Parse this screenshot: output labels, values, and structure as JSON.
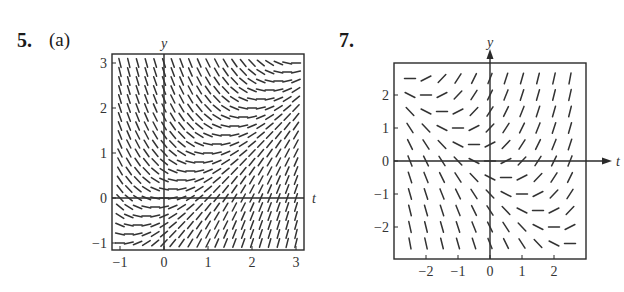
{
  "problems": [
    {
      "number": "5.",
      "part": "(a)"
    },
    {
      "number": "7.",
      "part": ""
    }
  ],
  "chart_data": [
    {
      "type": "slope-field",
      "id": "problem-5a",
      "title": "5. (a)",
      "xlabel": "t",
      "ylabel": "y",
      "equation_estimate": "y' = t - y",
      "xlim": [
        -1,
        3
      ],
      "ylim": [
        -1,
        3
      ],
      "xticks": [
        -1,
        0,
        1,
        2,
        3
      ],
      "yticks": [
        -1,
        0,
        1,
        2,
        3
      ],
      "xtick_labels": [
        "−1",
        "0",
        "1",
        "2",
        "3"
      ],
      "ytick_labels": [
        "−1",
        "0",
        "1",
        "2",
        "3"
      ],
      "grid": false,
      "axes_arrows": false,
      "sample_spacing": {
        "t": 0.2,
        "y": 0.2
      },
      "frame_px": {
        "left": 112,
        "right": 304,
        "top": 54,
        "bottom": 250
      },
      "origin_px": {
        "x": 164,
        "y": 198
      },
      "unit_px": {
        "x": 44,
        "y": 45
      },
      "segment_length_px": 9
    },
    {
      "type": "slope-field",
      "id": "problem-7",
      "title": "7.",
      "xlabel": "t",
      "ylabel": "y",
      "equation_estimate": "y' = t + y",
      "xlim": [
        -2.5,
        2.5
      ],
      "ylim": [
        -2.5,
        2.5
      ],
      "xticks": [
        -2,
        -1,
        0,
        1,
        2
      ],
      "yticks": [
        -2,
        -1,
        0,
        1,
        2
      ],
      "xtick_labels": [
        "−2",
        "−1",
        "0",
        "1",
        "2"
      ],
      "ytick_labels": [
        "−2",
        "−1",
        "0",
        "1",
        "2"
      ],
      "grid": false,
      "axes_arrows": true,
      "sample_spacing": {
        "t": 0.5,
        "y": 0.5
      },
      "frame_px": {
        "left": 394,
        "right": 586,
        "top": 63,
        "bottom": 259
      },
      "origin_px": {
        "x": 490,
        "y": 161
      },
      "unit_px": {
        "x": 32,
        "y": 33
      },
      "segment_length_px": 11
    }
  ]
}
